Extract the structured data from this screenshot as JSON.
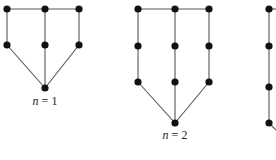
{
  "diagram": {
    "graphs": [
      {
        "id": "graph-n1",
        "label_var": "n",
        "label_rest": " = 1",
        "label_pos": [
          45,
          105
        ],
        "nodes": [
          [
            7,
            9
          ],
          [
            45,
            9
          ],
          [
            79,
            9
          ],
          [
            7,
            45
          ],
          [
            45,
            45
          ],
          [
            79,
            45
          ],
          [
            45,
            88
          ]
        ],
        "edges": [
          [
            0,
            1
          ],
          [
            1,
            2
          ],
          [
            0,
            3
          ],
          [
            1,
            4
          ],
          [
            2,
            5
          ],
          [
            3,
            6
          ],
          [
            4,
            6
          ],
          [
            5,
            6
          ]
        ]
      },
      {
        "id": "graph-n2",
        "label_var": "n",
        "label_rest": " = 2",
        "label_pos": [
          175,
          139
        ],
        "nodes": [
          [
            138,
            9
          ],
          [
            175,
            9
          ],
          [
            209,
            9
          ],
          [
            138,
            46
          ],
          [
            175,
            46
          ],
          [
            209,
            46
          ],
          [
            138,
            82
          ],
          [
            175,
            82
          ],
          [
            209,
            82
          ],
          [
            175,
            123
          ]
        ],
        "edges": [
          [
            0,
            1
          ],
          [
            1,
            2
          ],
          [
            0,
            3
          ],
          [
            1,
            4
          ],
          [
            2,
            5
          ],
          [
            3,
            6
          ],
          [
            4,
            7
          ],
          [
            5,
            8
          ],
          [
            6,
            9
          ],
          [
            7,
            9
          ],
          [
            8,
            9
          ]
        ]
      },
      {
        "id": "graph-n3-partial",
        "label_var": "",
        "label_rest": "",
        "nodes": [
          [
            269,
            9
          ],
          [
            269,
            46
          ],
          [
            269,
            87
          ],
          [
            269,
            123
          ]
        ],
        "edges": [
          [
            0,
            1
          ],
          [
            1,
            2
          ],
          [
            2,
            3
          ]
        ],
        "stubs": [
          [
            [
              269,
              9
            ],
            [
              276,
              9
            ]
          ],
          [
            [
              269,
              123
            ],
            [
              276,
              130
            ]
          ]
        ]
      }
    ],
    "colors": {
      "edge": "#555555",
      "node": "#111111",
      "background": "#ffffff"
    }
  }
}
